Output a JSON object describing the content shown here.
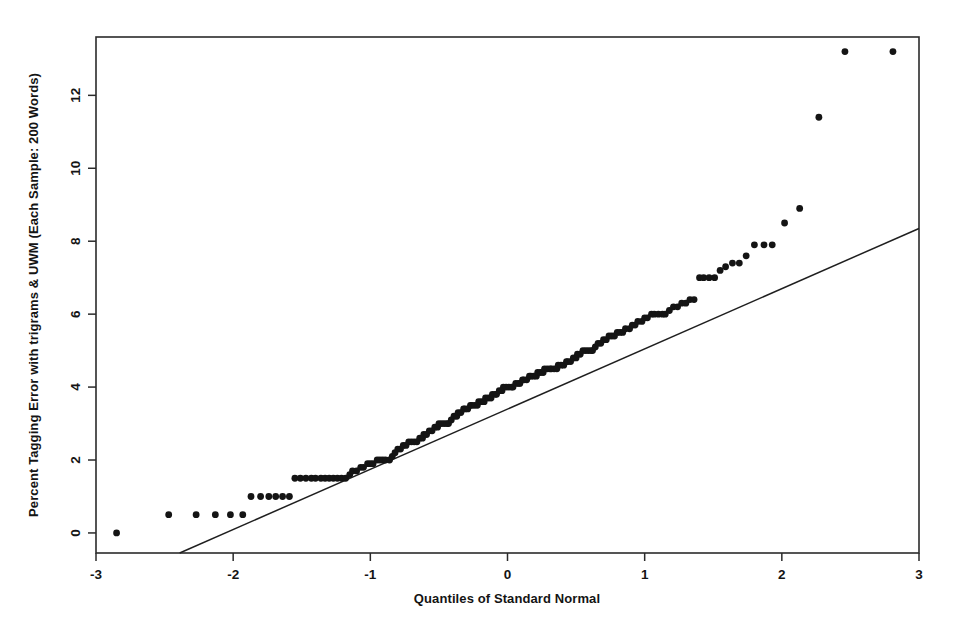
{
  "chart_data": {
    "type": "scatter",
    "title": "",
    "subtitle": "",
    "xlabel": "Quantiles of Standard Normal",
    "ylabel": "Percent Tagging Error with trigrams & UWM (Each Sample: 200 Words)",
    "xlim": [
      -3.0,
      3.0
    ],
    "ylim": [
      -0.55,
      13.6
    ],
    "xticks": [
      -3,
      -2,
      -1,
      0,
      1,
      2,
      3
    ],
    "xticklabels": [
      "-3",
      "-2",
      "-1",
      "0",
      "1",
      "2",
      "3"
    ],
    "yticks": [
      0,
      2,
      4,
      6,
      8,
      10,
      12
    ],
    "yticklabels": [
      "0",
      "2",
      "4",
      "6",
      "8",
      "10",
      "12"
    ],
    "grid": false,
    "legend": null,
    "legend_position": "none",
    "marker": "filled-circle",
    "marker_size_px": 3.4,
    "point_color": "#141414",
    "line_color": "#1f1f1f",
    "frame_color": "#2b2b2b",
    "reference_line": {
      "label": "qq reference line",
      "x_start": -2.39,
      "y_start": -0.55,
      "x_end": 3.0,
      "y_end": 8.35,
      "slope": 1.651,
      "intercept": 3.397
    },
    "annotations": [],
    "x": [
      -2.85,
      -2.47,
      -2.27,
      -2.13,
      -2.02,
      -1.93,
      -1.87,
      -1.8,
      -1.74,
      -1.69,
      -1.64,
      -1.59,
      -1.55,
      -1.51,
      -1.47,
      -1.43,
      -1.4,
      -1.36,
      -1.33,
      -1.3,
      -1.27,
      -1.24,
      -1.21,
      -1.18,
      -1.15,
      -1.13,
      -1.1,
      -1.07,
      -1.05,
      -1.02,
      -1.0,
      -0.98,
      -0.95,
      -0.93,
      -0.91,
      -0.89,
      -0.86,
      -0.84,
      -0.82,
      -0.8,
      -0.78,
      -0.76,
      -0.74,
      -0.72,
      -0.7,
      -0.68,
      -0.66,
      -0.64,
      -0.62,
      -0.61,
      -0.59,
      -0.57,
      -0.55,
      -0.53,
      -0.51,
      -0.5,
      -0.48,
      -0.46,
      -0.44,
      -0.43,
      -0.41,
      -0.39,
      -0.37,
      -0.36,
      -0.34,
      -0.32,
      -0.31,
      -0.29,
      -0.27,
      -0.26,
      -0.24,
      -0.22,
      -0.21,
      -0.19,
      -0.17,
      -0.16,
      -0.14,
      -0.12,
      -0.11,
      -0.09,
      -0.08,
      -0.06,
      -0.04,
      -0.03,
      -0.01,
      0.01,
      0.03,
      0.04,
      0.06,
      0.08,
      0.09,
      0.11,
      0.12,
      0.14,
      0.16,
      0.17,
      0.19,
      0.21,
      0.22,
      0.24,
      0.26,
      0.27,
      0.29,
      0.31,
      0.32,
      0.34,
      0.36,
      0.37,
      0.39,
      0.41,
      0.43,
      0.44,
      0.46,
      0.48,
      0.5,
      0.51,
      0.53,
      0.55,
      0.57,
      0.59,
      0.61,
      0.62,
      0.64,
      0.66,
      0.68,
      0.7,
      0.72,
      0.74,
      0.76,
      0.78,
      0.8,
      0.82,
      0.84,
      0.86,
      0.89,
      0.91,
      0.93,
      0.95,
      0.98,
      1.0,
      1.02,
      1.05,
      1.07,
      1.1,
      1.13,
      1.15,
      1.18,
      1.21,
      1.24,
      1.27,
      1.3,
      1.33,
      1.36,
      1.4,
      1.43,
      1.47,
      1.51,
      1.55,
      1.59,
      1.64,
      1.69,
      1.74,
      1.8,
      1.87,
      1.93,
      2.02,
      2.13,
      2.27,
      2.46,
      2.81
    ],
    "y": [
      0.0,
      0.5,
      0.5,
      0.5,
      0.5,
      0.5,
      1.0,
      1.0,
      1.0,
      1.0,
      1.0,
      1.0,
      1.5,
      1.5,
      1.5,
      1.5,
      1.5,
      1.5,
      1.5,
      1.5,
      1.5,
      1.5,
      1.5,
      1.5,
      1.6,
      1.7,
      1.7,
      1.8,
      1.8,
      1.9,
      1.9,
      1.9,
      2.0,
      2.0,
      2.0,
      2.0,
      2.0,
      2.1,
      2.2,
      2.3,
      2.3,
      2.4,
      2.4,
      2.5,
      2.5,
      2.5,
      2.5,
      2.6,
      2.6,
      2.7,
      2.7,
      2.8,
      2.8,
      2.9,
      2.9,
      3.0,
      3.0,
      3.0,
      3.0,
      3.0,
      3.1,
      3.2,
      3.2,
      3.3,
      3.3,
      3.4,
      3.4,
      3.4,
      3.5,
      3.5,
      3.5,
      3.5,
      3.6,
      3.6,
      3.6,
      3.7,
      3.7,
      3.7,
      3.8,
      3.8,
      3.8,
      3.9,
      3.9,
      4.0,
      4.0,
      4.0,
      4.0,
      4.0,
      4.1,
      4.1,
      4.1,
      4.2,
      4.2,
      4.2,
      4.3,
      4.3,
      4.3,
      4.3,
      4.4,
      4.4,
      4.4,
      4.5,
      4.5,
      4.5,
      4.5,
      4.5,
      4.5,
      4.6,
      4.6,
      4.6,
      4.7,
      4.7,
      4.7,
      4.8,
      4.8,
      4.9,
      4.9,
      5.0,
      5.0,
      5.0,
      5.0,
      5.0,
      5.1,
      5.2,
      5.2,
      5.3,
      5.3,
      5.4,
      5.4,
      5.4,
      5.5,
      5.5,
      5.5,
      5.6,
      5.6,
      5.7,
      5.7,
      5.8,
      5.8,
      5.9,
      5.9,
      6.0,
      6.0,
      6.0,
      6.0,
      6.0,
      6.1,
      6.2,
      6.2,
      6.3,
      6.3,
      6.4,
      6.4,
      7.0,
      7.0,
      7.0,
      7.0,
      7.2,
      7.3,
      7.4,
      7.4,
      7.6,
      7.9,
      7.9,
      7.9,
      8.5,
      8.9,
      11.4,
      13.2,
      13.2
    ],
    "n_points": 170,
    "note": "Normal Q-Q plot of percent tagging error; values quantized to 0.5 at low end"
  },
  "figure": {
    "background_color": "#ffffff",
    "ink_color": "#141414"
  }
}
